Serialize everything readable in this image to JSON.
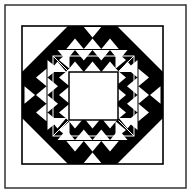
{
  "figure": {
    "colors": {
      "ink": "#000000",
      "paper": "#ffffff",
      "frame": "#333333"
    },
    "outer_frame": {
      "x": 5,
      "y": 5,
      "w": 181,
      "h": 183
    },
    "inner_frame": {
      "x": 22,
      "y": 26,
      "w": 141,
      "h": 138
    },
    "center_square": {
      "x": 69,
      "y": 72,
      "w": 49,
      "h": 48
    },
    "triangle_rows": 4
  }
}
